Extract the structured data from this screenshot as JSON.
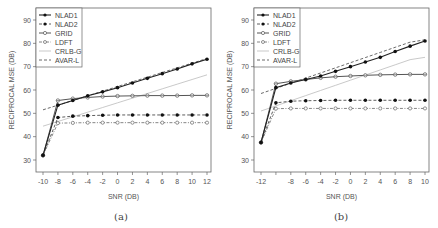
{
  "chart_data": [
    {
      "type": "line",
      "caption": "(a)",
      "xlabel": "SNR (DB)",
      "ylabel": "RECIPROCAL MSE (DB)",
      "x": [
        -10,
        -8,
        -6,
        -4,
        -2,
        0,
        2,
        4,
        6,
        8,
        10,
        12
      ],
      "xticks": [
        "-10",
        "-8",
        "-6",
        "-4",
        "-2",
        "0",
        "2",
        "4",
        "6",
        "8",
        "10",
        "12"
      ],
      "yticks": [
        "30",
        "40",
        "50",
        "60",
        "70",
        "80",
        "90"
      ],
      "ylim": [
        26,
        94
      ],
      "xlim": [
        -10.8,
        12.8
      ],
      "grid": false,
      "legend_position": "top-left",
      "series": [
        {
          "name": "NLAD1",
          "values": [
            32,
            53.5,
            55.5,
            57.5,
            59.2,
            61,
            63,
            65,
            67,
            69,
            71.2,
            73.2
          ]
        },
        {
          "name": "NLAD2",
          "values": [
            32,
            48.2,
            48.8,
            49,
            49.2,
            49.3,
            49.3,
            49.3,
            49.3,
            49.3,
            49.3,
            49.3
          ]
        },
        {
          "name": "GRID",
          "values": [
            32,
            55.5,
            56.3,
            56.8,
            57.2,
            57.4,
            57.5,
            57.6,
            57.6,
            57.6,
            57.7,
            57.7
          ]
        },
        {
          "name": "LDFT",
          "values": [
            32,
            45.8,
            45.9,
            46,
            46,
            46,
            46,
            46,
            46,
            46,
            46,
            46
          ]
        },
        {
          "name": "CRLB-G",
          "values": [
            44.5,
            46.5,
            48.5,
            50.5,
            52.5,
            54.5,
            56.5,
            58.5,
            60.5,
            62.5,
            64.5,
            66.5
          ]
        },
        {
          "name": "AVAR-L",
          "values": [
            51.5,
            53.5,
            55.5,
            57.5,
            59.5,
            61.5,
            63.5,
            65.5,
            67.5,
            69.5,
            71.5,
            73.5
          ]
        }
      ]
    },
    {
      "type": "line",
      "caption": "(b)",
      "xlabel": "SNR (DB)",
      "ylabel": "RECIPROCAL MSE (DB)",
      "x": [
        -12,
        -10,
        -8,
        -6,
        -4,
        -2,
        0,
        2,
        4,
        6,
        8,
        10
      ],
      "xticks": [
        "-12",
        "",
        "-8",
        "-6",
        "-4",
        "-2",
        "0",
        "2",
        "4",
        "6",
        "8",
        "10"
      ],
      "yticks": [
        "30",
        "40",
        "50",
        "60",
        "70",
        "80",
        "90"
      ],
      "ylim": [
        26,
        94
      ],
      "xlim": [
        -12.8,
        10.8
      ],
      "grid": false,
      "legend_position": "top-left",
      "series": [
        {
          "name": "NLAD1",
          "values": [
            37.5,
            61,
            63,
            64.5,
            66,
            68,
            70,
            72,
            74,
            76.5,
            78.8,
            81
          ]
        },
        {
          "name": "NLAD2",
          "values": [
            37.5,
            54.5,
            55.2,
            55.4,
            55.5,
            55.6,
            55.6,
            55.6,
            55.6,
            55.6,
            55.6,
            55.6
          ]
        },
        {
          "name": "GRID",
          "values": [
            37.5,
            62.7,
            63.7,
            64.5,
            65.2,
            65.7,
            66,
            66.3,
            66.5,
            66.6,
            66.7,
            66.7
          ]
        },
        {
          "name": "LDFT",
          "values": [
            37.5,
            52,
            52.1,
            52.1,
            52.1,
            52.1,
            52.1,
            52.1,
            52.1,
            52.1,
            52.1,
            52.1
          ]
        },
        {
          "name": "CRLB-G",
          "values": [
            51,
            53.2,
            55.4,
            57.6,
            59.8,
            62,
            64.2,
            66.4,
            68.6,
            70.8,
            73,
            74
          ]
        },
        {
          "name": "AVAR-L",
          "values": [
            58.5,
            60.7,
            62.9,
            65.1,
            67.3,
            69.5,
            71.7,
            73.9,
            76.1,
            78.3,
            80.5,
            81.5
          ]
        }
      ]
    }
  ],
  "legend": [
    "NLAD1",
    "NLAD2",
    "GRID",
    "LDFT",
    "CRLB-G",
    "AVAR-L"
  ],
  "captions": {
    "a": "(a)",
    "b": "(b)"
  },
  "xlabel": "SNR (DB)",
  "ylabel": "RECIPROCAL MSE (DB)"
}
